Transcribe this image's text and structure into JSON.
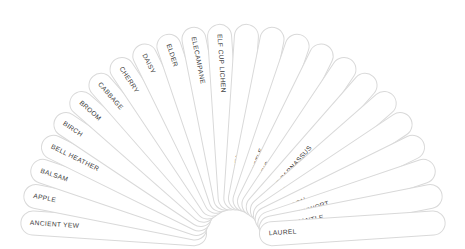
{
  "diagram": {
    "type": "radial-fan",
    "segment_count": 24,
    "colors": {
      "background": "#ffffff",
      "petal_fill": "#ffffff",
      "petal_border": "#d9d9d9",
      "label_text": "#3a3a3a"
    },
    "geometry": {
      "center_x": 233,
      "center_y": 236,
      "inner_radius": 26,
      "outer_radius": 213,
      "petal_thickness": 25,
      "start_angle_deg": 180,
      "sweep_deg": 180
    },
    "segments": [
      {
        "label": "ANCIENT YEW"
      },
      {
        "label": "APPLE"
      },
      {
        "label": "BALSAM"
      },
      {
        "label": "BELL HEATHER"
      },
      {
        "label": "BIRCH"
      },
      {
        "label": "BROOM"
      },
      {
        "label": "CABBAGE"
      },
      {
        "label": "CHERRY"
      },
      {
        "label": "DAISY"
      },
      {
        "label": "ELDER"
      },
      {
        "label": "ELECAMPANE"
      },
      {
        "label": "ELF CUP LICHEN"
      },
      {
        "label": "GARDEN PEA"
      },
      {
        "label": "GINKGO"
      },
      {
        "label": "GLOBE-THISTLE"
      },
      {
        "label": "GOLDEN IRIS"
      },
      {
        "label": "GORSE"
      },
      {
        "label": "GRASS OF PARNASSUS"
      },
      {
        "label": "HAREBELL"
      },
      {
        "label": "HAZEL"
      },
      {
        "label": "HOLY-THORN"
      },
      {
        "label": "IONA PENNYWORT"
      },
      {
        "label": "LADY'S MANTLE"
      },
      {
        "label": "LAUREL"
      }
    ]
  }
}
